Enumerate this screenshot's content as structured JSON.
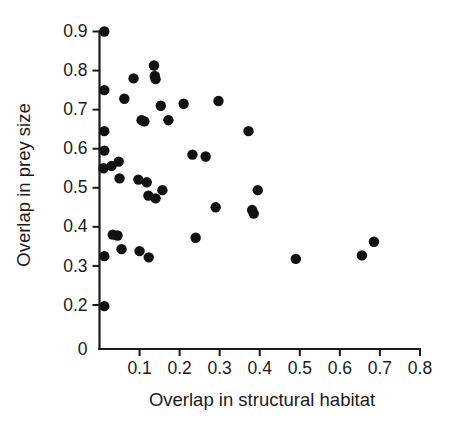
{
  "chart_data": {
    "type": "scatter",
    "title": "",
    "xlabel": "Overlap in structural habitat",
    "ylabel": "Overlap in prey size",
    "xlim": [
      0.0,
      0.8
    ],
    "ylim": [
      0.2,
      0.9
    ],
    "grid": false,
    "legend": null,
    "axis_break_y": true,
    "xticks": [
      0.1,
      0.2,
      0.3,
      0.4,
      0.5,
      0.6,
      0.7,
      0.8
    ],
    "xtick_labels": [
      "0.1",
      "0.2",
      "0.3",
      "0.4",
      "0.5",
      "0.6",
      "0.7",
      "0.8"
    ],
    "yticks": [
      0.2,
      0.3,
      0.4,
      0.5,
      0.6,
      0.7,
      0.8,
      0.9
    ],
    "ytick_labels": [
      "0.2",
      "0.3",
      "0.4",
      "0.5",
      "0.6",
      "0.7",
      "0.8",
      "0.9"
    ],
    "y_origin_label": "0",
    "marker": "filled-circle",
    "marker_color": "#111111",
    "marker_size_px": 5.2,
    "points": [
      {
        "x": 0.012,
        "y": 0.9
      },
      {
        "x": 0.012,
        "y": 0.75
      },
      {
        "x": 0.012,
        "y": 0.645
      },
      {
        "x": 0.012,
        "y": 0.595
      },
      {
        "x": 0.01,
        "y": 0.55
      },
      {
        "x": 0.012,
        "y": 0.325
      },
      {
        "x": 0.012,
        "y": 0.197
      },
      {
        "x": 0.03,
        "y": 0.556
      },
      {
        "x": 0.033,
        "y": 0.38
      },
      {
        "x": 0.045,
        "y": 0.378
      },
      {
        "x": 0.048,
        "y": 0.567
      },
      {
        "x": 0.05,
        "y": 0.524
      },
      {
        "x": 0.055,
        "y": 0.343
      },
      {
        "x": 0.062,
        "y": 0.728
      },
      {
        "x": 0.085,
        "y": 0.78
      },
      {
        "x": 0.097,
        "y": 0.521
      },
      {
        "x": 0.1,
        "y": 0.338
      },
      {
        "x": 0.105,
        "y": 0.673
      },
      {
        "x": 0.112,
        "y": 0.67
      },
      {
        "x": 0.118,
        "y": 0.514
      },
      {
        "x": 0.122,
        "y": 0.48
      },
      {
        "x": 0.123,
        "y": 0.322
      },
      {
        "x": 0.136,
        "y": 0.813
      },
      {
        "x": 0.138,
        "y": 0.786
      },
      {
        "x": 0.14,
        "y": 0.778
      },
      {
        "x": 0.14,
        "y": 0.473
      },
      {
        "x": 0.153,
        "y": 0.71
      },
      {
        "x": 0.157,
        "y": 0.494
      },
      {
        "x": 0.172,
        "y": 0.673
      },
      {
        "x": 0.21,
        "y": 0.715
      },
      {
        "x": 0.232,
        "y": 0.585
      },
      {
        "x": 0.24,
        "y": 0.372
      },
      {
        "x": 0.265,
        "y": 0.58
      },
      {
        "x": 0.29,
        "y": 0.45
      },
      {
        "x": 0.297,
        "y": 0.722
      },
      {
        "x": 0.372,
        "y": 0.645
      },
      {
        "x": 0.381,
        "y": 0.443
      },
      {
        "x": 0.385,
        "y": 0.434
      },
      {
        "x": 0.395,
        "y": 0.494
      },
      {
        "x": 0.49,
        "y": 0.318
      },
      {
        "x": 0.655,
        "y": 0.327
      },
      {
        "x": 0.685,
        "y": 0.362
      }
    ]
  }
}
